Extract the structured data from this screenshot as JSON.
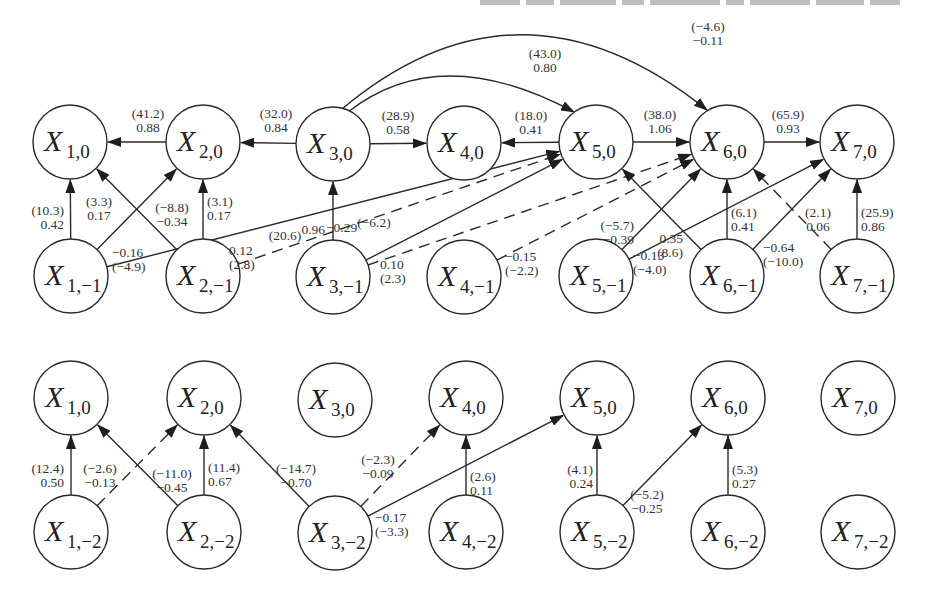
{
  "figure": {
    "type": "dynamic-bayesian-network-diagram",
    "top_text_cutoff": "partially visible line of text cut off at top edge (illegible)",
    "legend": {
      "label_format": "t-statistic in parentheses above, coefficient below",
      "solid_edge": "solid arrow",
      "dashed_edge": "dashed arrow"
    },
    "colors": {
      "stroke": "#2a2a2a",
      "text": "#333333",
      "background": "#ffffff"
    }
  },
  "panels": [
    {
      "id": "panel-lag1",
      "nodes": [
        {
          "id": "X1_0",
          "main": "X",
          "sub": "1,0",
          "cx": 70,
          "cy": 142
        },
        {
          "id": "X2_0",
          "main": "X",
          "sub": "2,0",
          "cx": 203,
          "cy": 142
        },
        {
          "id": "X3_0",
          "main": "X",
          "sub": "3,0",
          "cx": 333,
          "cy": 144
        },
        {
          "id": "X4_0",
          "main": "X",
          "sub": "4,0",
          "cx": 464,
          "cy": 143
        },
        {
          "id": "X5_0",
          "main": "X",
          "sub": "5,0",
          "cx": 596,
          "cy": 142
        },
        {
          "id": "X6_0",
          "main": "X",
          "sub": "6,0",
          "cx": 727,
          "cy": 142
        },
        {
          "id": "X7_0",
          "main": "X",
          "sub": "7,0",
          "cx": 857,
          "cy": 142
        },
        {
          "id": "X1_m1",
          "main": "X",
          "sub": "1,−1",
          "cx": 71,
          "cy": 276
        },
        {
          "id": "X2_m1",
          "main": "X",
          "sub": "2,−1",
          "cx": 203,
          "cy": 276
        },
        {
          "id": "X3_m1",
          "main": "X",
          "sub": "3,−1",
          "cx": 333,
          "cy": 277
        },
        {
          "id": "X4_m1",
          "main": "X",
          "sub": "4,−1",
          "cx": 464,
          "cy": 277
        },
        {
          "id": "X5_m1",
          "main": "X",
          "sub": "5,−1",
          "cx": 596,
          "cy": 276
        },
        {
          "id": "X6_m1",
          "main": "X",
          "sub": "6,−1",
          "cx": 727,
          "cy": 276
        },
        {
          "id": "X7_m1",
          "main": "X",
          "sub": "7,−1",
          "cx": 857,
          "cy": 276
        }
      ],
      "edges": [
        {
          "from": "X2_0",
          "to": "X1_0",
          "style": "solid",
          "t": "(41.2)",
          "coef": "0.88",
          "lx": 148,
          "ly": 118,
          "anchor": "middle"
        },
        {
          "from": "X3_0",
          "to": "X2_0",
          "style": "solid",
          "t": "(32.0)",
          "coef": "0.84",
          "lx": 276,
          "ly": 118,
          "anchor": "middle"
        },
        {
          "from": "X3_0",
          "to": "X4_0",
          "style": "solid",
          "t": "(28.9)",
          "coef": "0.58",
          "lx": 398,
          "ly": 120,
          "anchor": "middle"
        },
        {
          "from": "X5_0",
          "to": "X4_0",
          "style": "solid",
          "t": "(18.0)",
          "coef": "0.41",
          "lx": 531,
          "ly": 120,
          "anchor": "middle"
        },
        {
          "from": "X5_0",
          "to": "X6_0",
          "style": "solid",
          "t": "(38.0)",
          "coef": "1.06",
          "lx": 660,
          "ly": 119,
          "anchor": "middle"
        },
        {
          "from": "X6_0",
          "to": "X7_0",
          "style": "solid",
          "t": "(65.9)",
          "coef": "0.93",
          "lx": 788,
          "ly": 119,
          "anchor": "middle"
        },
        {
          "from": "X3_0",
          "to": "X5_0",
          "style": "solid",
          "curve": "M 348 112 Q 440 40 574 112",
          "t": "(43.0)",
          "coef": "0.80",
          "lx": 545,
          "ly": 58,
          "anchor": "middle"
        },
        {
          "from": "X3_0",
          "to": "X6_0",
          "style": "solid",
          "curve": "M 342 109 Q 520 -40 707 110",
          "t": "(−4.6)",
          "coef": "−0.11",
          "lx": 708,
          "ly": 31,
          "anchor": "middle"
        },
        {
          "from": "X1_m1",
          "to": "X1_0",
          "style": "solid",
          "t": "(10.3)",
          "coef": "0.42",
          "lx": 64,
          "ly": 215,
          "anchor": "end"
        },
        {
          "from": "X1_m1",
          "to": "X2_0",
          "style": "solid",
          "t": "(3.3)",
          "coef": "0.17",
          "lx": 99,
          "ly": 206,
          "anchor": "middle"
        },
        {
          "from": "X2_m1",
          "to": "X1_0",
          "style": "solid",
          "t": "(−8.8)",
          "coef": "−0.34",
          "lx": 172,
          "ly": 212,
          "anchor": "middle"
        },
        {
          "from": "X2_m1",
          "to": "X2_0",
          "style": "solid",
          "t": "(3.1)",
          "coef": "0.17",
          "lx": 207,
          "ly": 206,
          "anchor": "start"
        },
        {
          "from": "X1_m1",
          "to": "X5_0",
          "style": "solid",
          "t": "−0.16",
          "coef": "(−4.9)",
          "lx": 112,
          "ly": 257,
          "anchor": "start",
          "order": "coef-first"
        },
        {
          "from": "X2_m1",
          "to": "X5_0",
          "style": "dashed",
          "t": "0.12",
          "coef": "(2.8)",
          "lx": 229,
          "ly": 255,
          "anchor": "start",
          "order": "coef-first"
        },
        {
          "from": "X3_m1",
          "to": "X3_0",
          "style": "solid",
          "t": "(20.6)",
          "coef": "0.96",
          "lx": 325,
          "ly": 240,
          "anchor": "end",
          "layout": "inline"
        },
        {
          "from": "X3_m1",
          "to": "X5_0",
          "style": "solid",
          "t": "−0.29",
          "coef": "(−6.2)",
          "lx": 326,
          "ly": 232,
          "anchor": "start",
          "layout": "inline"
        },
        {
          "from": "X3_m1",
          "to": "X6_0",
          "style": "dashed",
          "t": "0.10",
          "coef": "(2.3)",
          "lx": 380,
          "ly": 269,
          "anchor": "start",
          "order": "coef-first"
        },
        {
          "from": "X4_m1",
          "to": "X6_0",
          "style": "dashed",
          "t": "−0.15",
          "coef": "(−2.2)",
          "lx": 505,
          "ly": 261,
          "anchor": "start",
          "order": "coef-first"
        },
        {
          "from": "X5_m1",
          "to": "X6_0",
          "style": "solid",
          "t": "(−5.7)",
          "coef": "−0.39",
          "lx": 634,
          "ly": 230,
          "anchor": "end"
        },
        {
          "from": "X5_m1",
          "to": "X7_0",
          "style": "solid",
          "t": "−0.13",
          "coef": "(−4.0)",
          "lx": 633,
          "ly": 260,
          "anchor": "start",
          "order": "coef-first"
        },
        {
          "from": "X6_m1",
          "to": "X5_0",
          "style": "solid",
          "t": "0.35",
          "coef": "(8.6)",
          "lx": 683,
          "ly": 243,
          "anchor": "end",
          "order": "coef-first"
        },
        {
          "from": "X6_m1",
          "to": "X6_0",
          "style": "solid",
          "t": "(6.1)",
          "coef": "0.41",
          "lx": 731,
          "ly": 217,
          "anchor": "start"
        },
        {
          "from": "X6_m1",
          "to": "X7_0",
          "style": "solid",
          "t": "−0.64",
          "coef": "(−10.0)",
          "lx": 763,
          "ly": 252,
          "anchor": "start",
          "order": "coef-first"
        },
        {
          "from": "X7_m1",
          "to": "X6_0",
          "style": "dashed",
          "t": "(2.1)",
          "coef": "0.06",
          "lx": 818,
          "ly": 217,
          "anchor": "middle"
        },
        {
          "from": "X7_m1",
          "to": "X7_0",
          "style": "solid",
          "t": "(25.9)",
          "coef": "0.86",
          "lx": 861,
          "ly": 217,
          "anchor": "start"
        }
      ]
    },
    {
      "id": "panel-lag2",
      "nodes": [
        {
          "id": "B_X1_0",
          "main": "X",
          "sub": "1,0",
          "cx": 71,
          "cy": 398
        },
        {
          "id": "B_X2_0",
          "main": "X",
          "sub": "2,0",
          "cx": 204,
          "cy": 398
        },
        {
          "id": "B_X3_0",
          "main": "X",
          "sub": "3,0",
          "cx": 335,
          "cy": 400
        },
        {
          "id": "B_X4_0",
          "main": "X",
          "sub": "4,0",
          "cx": 466,
          "cy": 398
        },
        {
          "id": "B_X5_0",
          "main": "X",
          "sub": "5,0",
          "cx": 597,
          "cy": 398
        },
        {
          "id": "B_X6_0",
          "main": "X",
          "sub": "6,0",
          "cx": 728,
          "cy": 398
        },
        {
          "id": "B_X7_0",
          "main": "X",
          "sub": "7,0",
          "cx": 858,
          "cy": 398
        },
        {
          "id": "B_X1_m2",
          "main": "X",
          "sub": "1,−2",
          "cx": 71,
          "cy": 532
        },
        {
          "id": "B_X2_m2",
          "main": "X",
          "sub": "2,−2",
          "cx": 204,
          "cy": 532
        },
        {
          "id": "B_X3_m2",
          "main": "X",
          "sub": "3,−2",
          "cx": 335,
          "cy": 533
        },
        {
          "id": "B_X4_m2",
          "main": "X",
          "sub": "4,−2",
          "cx": 466,
          "cy": 532
        },
        {
          "id": "B_X5_m2",
          "main": "X",
          "sub": "5,−2",
          "cx": 597,
          "cy": 532
        },
        {
          "id": "B_X6_m2",
          "main": "X",
          "sub": "6,−2",
          "cx": 728,
          "cy": 532
        },
        {
          "id": "B_X7_m2",
          "main": "X",
          "sub": "7,−2",
          "cx": 858,
          "cy": 532
        }
      ],
      "edges": [
        {
          "from": "B_X1_m2",
          "to": "B_X1_0",
          "style": "solid",
          "t": "(12.4)",
          "coef": "0.50",
          "lx": 64,
          "ly": 473,
          "anchor": "end"
        },
        {
          "from": "B_X1_m2",
          "to": "B_X2_0",
          "style": "dashed",
          "t": "(−2.6)",
          "coef": "−0.13",
          "lx": 100,
          "ly": 473,
          "anchor": "middle"
        },
        {
          "from": "B_X2_m2",
          "to": "B_X1_0",
          "style": "solid",
          "t": "(−11.0)",
          "coef": "−0.45",
          "lx": 172,
          "ly": 478,
          "anchor": "middle"
        },
        {
          "from": "B_X2_m2",
          "to": "B_X2_0",
          "style": "solid",
          "t": "(11.4)",
          "coef": "0.67",
          "lx": 208,
          "ly": 472,
          "anchor": "start"
        },
        {
          "from": "B_X3_m2",
          "to": "B_X2_0",
          "style": "solid",
          "t": "(−14.7)",
          "coef": "−0.70",
          "lx": 296,
          "ly": 473,
          "anchor": "middle"
        },
        {
          "from": "B_X3_m2",
          "to": "B_X4_0",
          "style": "dashed",
          "t": "(−2.3)",
          "coef": "−0.09",
          "lx": 378,
          "ly": 464,
          "anchor": "middle"
        },
        {
          "from": "B_X4_m2",
          "to": "B_X4_0",
          "style": "solid",
          "t": "(2.6)",
          "coef": "0.11",
          "lx": 470,
          "ly": 481,
          "anchor": "start"
        },
        {
          "from": "B_X3_m2",
          "to": "B_X5_0",
          "style": "solid",
          "t": "−0.17",
          "coef": "(−3.3)",
          "lx": 375,
          "ly": 522,
          "anchor": "start",
          "order": "coef-first"
        },
        {
          "from": "B_X5_m2",
          "to": "B_X5_0",
          "style": "solid",
          "t": "(4.1)",
          "coef": "0.24",
          "lx": 593,
          "ly": 474,
          "anchor": "end"
        },
        {
          "from": "B_X5_m2",
          "to": "B_X6_0",
          "style": "solid",
          "t": "(−5.2)",
          "coef": "−0.25",
          "lx": 647,
          "ly": 499,
          "anchor": "middle"
        },
        {
          "from": "B_X6_m2",
          "to": "B_X6_0",
          "style": "solid",
          "t": "(5.3)",
          "coef": "0.27",
          "lx": 732,
          "ly": 474,
          "anchor": "start"
        }
      ]
    }
  ],
  "node_radius": 37
}
